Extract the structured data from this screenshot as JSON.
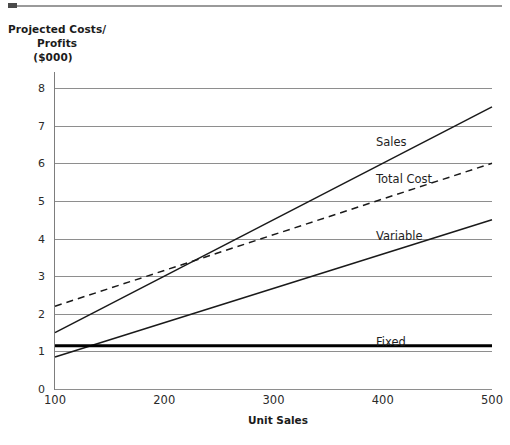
{
  "chart_data": {
    "type": "line",
    "title": "Projected Costs/ Profits ($000)",
    "title_lines": [
      "Projected Costs/",
      "Profits",
      "($000)"
    ],
    "xlabel": "Unit Sales",
    "ylabel": "Projected Costs/ Profits ($000)",
    "xlim": [
      100,
      500
    ],
    "ylim": [
      0,
      8
    ],
    "xticks": [
      "100",
      "200",
      "300",
      "400",
      "500"
    ],
    "xtick_values": [
      100,
      200,
      300,
      400,
      500
    ],
    "yticks": [
      "0",
      "1",
      "2",
      "3",
      "4",
      "5",
      "6",
      "7",
      "8"
    ],
    "ytick_values": [
      0,
      1,
      2,
      3,
      4,
      5,
      6,
      7,
      8
    ],
    "grid": "horizontal",
    "legend": "inline-labels",
    "x": [
      100,
      500
    ],
    "series": [
      {
        "name": "Sales",
        "values": [
          1.5,
          7.5
        ],
        "style": "solid",
        "color": "#1a1a1a",
        "width": 1.5,
        "label": "Sales",
        "label_x": 376,
        "label_y": 135
      },
      {
        "name": "Total Cost",
        "values": [
          2.2,
          6.0
        ],
        "style": "dashed",
        "color": "#1a1a1a",
        "width": 1.5,
        "label": "Total Cost",
        "label_x": 376,
        "label_y": 172
      },
      {
        "name": "Variable",
        "values": [
          0.85,
          4.5
        ],
        "style": "solid",
        "color": "#1a1a1a",
        "width": 1.5,
        "label": "Variable",
        "label_x": 376,
        "label_y": 229
      },
      {
        "name": "Fixed",
        "values": [
          1.15,
          1.15
        ],
        "style": "solid-thick",
        "color": "#000000",
        "width": 3.2,
        "label": "Fixed",
        "label_x": 376,
        "label_y": 335
      }
    ],
    "annotations": [
      {
        "name": "break-even",
        "x": 210,
        "y": 3.1
      }
    ]
  }
}
